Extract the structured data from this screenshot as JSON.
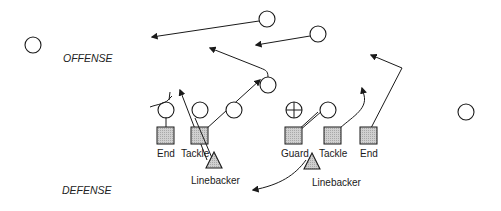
{
  "diagram": {
    "sides": {
      "offense": "OFFENSE",
      "defense": "DEFENSE"
    },
    "labels": {
      "end_left": "End",
      "tackle_left": "Tackle",
      "guard": "Guard",
      "tackle_right": "Tackle",
      "end_right": "End",
      "linebacker_left": "Linebacker",
      "linebacker_right": "Linebacker"
    },
    "offense_players": [
      {
        "id": "wide-left",
        "x": 33,
        "y": 45
      },
      {
        "id": "deep-receiver-1",
        "x": 267,
        "y": 19
      },
      {
        "id": "deep-receiver-2",
        "x": 318,
        "y": 34
      },
      {
        "id": "back",
        "x": 268,
        "y": 85
      },
      {
        "id": "line-1",
        "x": 166,
        "y": 110
      },
      {
        "id": "line-2",
        "x": 200,
        "y": 110
      },
      {
        "id": "line-3",
        "x": 234,
        "y": 110
      },
      {
        "id": "center",
        "x": 294,
        "y": 110,
        "marked": true
      },
      {
        "id": "line-5",
        "x": 328,
        "y": 110
      },
      {
        "id": "wide-right",
        "x": 466,
        "y": 112
      }
    ],
    "defense_players": [
      {
        "id": "end-left",
        "x": 166,
        "y": 136
      },
      {
        "id": "tackle-left",
        "x": 200,
        "y": 136
      },
      {
        "id": "guard",
        "x": 294,
        "y": 136
      },
      {
        "id": "tackle-right",
        "x": 333,
        "y": 136
      },
      {
        "id": "end-right",
        "x": 368,
        "y": 136
      }
    ],
    "colors": {
      "stroke": "#1a1a1a",
      "fill_defense": "#c8c8c8"
    }
  }
}
